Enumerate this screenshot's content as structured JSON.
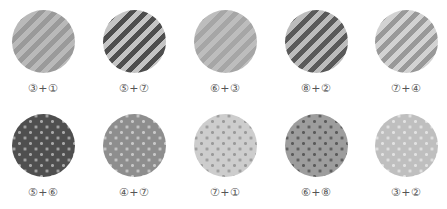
{
  "swatches": [
    {
      "label": "③+①",
      "pattern": "stripes",
      "base": "#b9b9b9",
      "accent": "#9a9a9a"
    },
    {
      "label": "⑤+⑦",
      "pattern": "stripes",
      "base": "#c4c4c4",
      "accent": "#4e4e4e"
    },
    {
      "label": "⑥+③",
      "pattern": "stripes",
      "base": "#bdbdbd",
      "accent": "#a6a6a6"
    },
    {
      "label": "⑧+②",
      "pattern": "stripes",
      "base": "#bcbcbc",
      "accent": "#5a5a5a"
    },
    {
      "label": "⑦+④",
      "pattern": "stripes",
      "base": "#d2d2d2",
      "accent": "#999999"
    },
    {
      "label": "⑤+⑥",
      "pattern": "dots",
      "base": "#4f4f4f",
      "accent": "#a8a8a8"
    },
    {
      "label": "④+⑦",
      "pattern": "dots",
      "base": "#8e8e8e",
      "accent": "#c8c8c8"
    },
    {
      "label": "⑦+①",
      "pattern": "dots",
      "base": "#cdcdcd",
      "accent": "#9a9a9a"
    },
    {
      "label": "⑥+⑧",
      "pattern": "dots",
      "base": "#9d9d9d",
      "accent": "#5a5a5a"
    },
    {
      "label": "③+②",
      "pattern": "dots",
      "base": "#bfbfbf",
      "accent": "#e2e2e2"
    }
  ]
}
